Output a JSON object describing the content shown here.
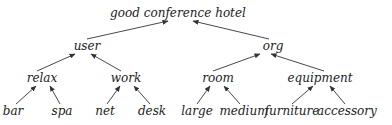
{
  "diagram": {
    "type": "tree",
    "direction": "bottom-up arrows (children point to parent)",
    "colors": {
      "text": "#222222",
      "edge": "#333333",
      "background": "#ffffff"
    },
    "nodes": [
      {
        "id": "root",
        "label": "good conference hotel",
        "level": 0
      },
      {
        "id": "user",
        "label": "user",
        "level": 1,
        "parent": "root"
      },
      {
        "id": "org",
        "label": "org",
        "level": 1,
        "parent": "root"
      },
      {
        "id": "relax",
        "label": "relax",
        "level": 2,
        "parent": "user"
      },
      {
        "id": "work",
        "label": "work",
        "level": 2,
        "parent": "user"
      },
      {
        "id": "room",
        "label": "room",
        "level": 2,
        "parent": "org"
      },
      {
        "id": "equipment",
        "label": "equipment",
        "level": 2,
        "parent": "org"
      },
      {
        "id": "bar",
        "label": "bar",
        "level": 3,
        "parent": "relax"
      },
      {
        "id": "spa",
        "label": "spa",
        "level": 3,
        "parent": "relax"
      },
      {
        "id": "net",
        "label": "net",
        "level": 3,
        "parent": "work"
      },
      {
        "id": "desk",
        "label": "desk",
        "level": 3,
        "parent": "work"
      },
      {
        "id": "large",
        "label": "large",
        "level": 3,
        "parent": "room"
      },
      {
        "id": "medium",
        "label": "medium",
        "level": 3,
        "parent": "room"
      },
      {
        "id": "furniture",
        "label": "furniture",
        "level": 3,
        "parent": "equipment"
      },
      {
        "id": "accessory",
        "label": "accessory",
        "level": 3,
        "parent": "equipment"
      }
    ]
  }
}
